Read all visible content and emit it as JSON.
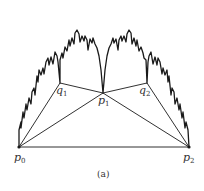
{
  "figure": {
    "caption": "(a)",
    "points": {
      "p0": {
        "label": "p",
        "sub": "0",
        "x": 19,
        "y": 147
      },
      "p1": {
        "label": "p",
        "sub": "1",
        "x": 103,
        "y": 93
      },
      "p2": {
        "label": "p",
        "sub": "2",
        "x": 189,
        "y": 147
      },
      "q1": {
        "label": "q",
        "sub": "1",
        "x": 60,
        "y": 83
      },
      "q2": {
        "label": "q",
        "sub": "2",
        "x": 147,
        "y": 83
      }
    },
    "segments": [
      [
        "p0",
        "p2"
      ],
      [
        "p0",
        "q1"
      ],
      [
        "p0",
        "p1"
      ],
      [
        "q1",
        "p1"
      ],
      [
        "p1",
        "q2"
      ],
      [
        "p1",
        "p2"
      ],
      [
        "q2",
        "p2"
      ]
    ],
    "curve": "fractal arc from p0 to p2 with cusps at q1, p1, q2",
    "colors": {
      "stroke": "#1a1a1a",
      "text": "#333333",
      "background": "#ffffff"
    }
  }
}
